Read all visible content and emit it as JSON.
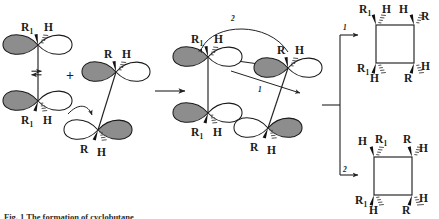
{
  "figure": {
    "caption": "Fig. 1 The formation of cyclobutane",
    "background_color": "#ffffff",
    "ink_color": "#1a1a1a",
    "lobe_fill_color": "#8d8d8d",
    "lobe_open_color": "#ffffff"
  },
  "labels": {
    "R": "R",
    "R1": "R",
    "R1_sub": "1",
    "H": "H",
    "plus": "+",
    "path_1": "1",
    "path_2": "2"
  },
  "reactants": {
    "alkene_1": {
      "name": "alkene-one",
      "top_carbon": {
        "left_substituent": "R",
        "left_subscript": "1",
        "right_substituent": "H"
      },
      "bottom_carbon": {
        "left_substituent": "R",
        "left_subscript": "1",
        "right_substituent": "H"
      },
      "equilibrium_symbol": "⇌"
    },
    "alkene_2": {
      "name": "alkene-two",
      "top_carbon": {
        "left_substituent": "R",
        "right_substituent": "H"
      },
      "bottom_carbon": {
        "left_substituent": "R",
        "right_substituent": "H"
      }
    },
    "operator": "+"
  },
  "transition_state": {
    "name": "transition-state",
    "top_left_carbon": {
      "left_substituent": "R",
      "left_subscript": "1",
      "right_substituent": "H"
    },
    "bottom_left_carbon": {
      "left_substituent": "R",
      "left_subscript": "1",
      "right_substituent": "H"
    },
    "top_right_carbon": {
      "left_substituent": "R",
      "right_substituent": "H"
    },
    "bottom_right_carbon": {
      "left_substituent": "R",
      "right_substituent": "H"
    },
    "bond_forming_labels": [
      "1",
      "2"
    ]
  },
  "products": [
    {
      "name": "cyclobutane-product-1",
      "path_label": "1",
      "corners": {
        "top_left": {
          "first": "R",
          "first_subscript": "1",
          "first_style": "wedge",
          "second": "H",
          "second_style": "hash"
        },
        "top_right": {
          "first": "H",
          "first_style": "wedge",
          "second": "R",
          "second_style": "hash"
        },
        "bottom_left": {
          "first": "R",
          "first_subscript": "1",
          "first_style": "wedge",
          "second": "H",
          "second_style": "hash"
        },
        "bottom_right": {
          "first": "R",
          "first_style": "wedge",
          "second": "H",
          "second_style": "hash"
        }
      }
    },
    {
      "name": "cyclobutane-product-2",
      "path_label": "2",
      "corners": {
        "top_left": {
          "first": "H",
          "first_style": "wedge",
          "second": "R",
          "second_subscript": "1",
          "second_style": "hash"
        },
        "top_right": {
          "first": "R",
          "first_style": "wedge",
          "second": "H",
          "second_style": "hash"
        },
        "bottom_left": {
          "first": "R",
          "first_subscript": "1",
          "first_style": "wedge",
          "second": "H",
          "second_style": "hash"
        },
        "bottom_right": {
          "first": "R",
          "first_style": "wedge",
          "second": "H",
          "second_style": "hash"
        }
      }
    }
  ],
  "arrows": {
    "reaction_arrow": {
      "name": "reaction-arrow",
      "direction": "right"
    },
    "branch_1": {
      "name": "branch-arrow-1",
      "label": "1"
    },
    "branch_2": {
      "name": "branch-arrow-2",
      "label": "2"
    }
  }
}
